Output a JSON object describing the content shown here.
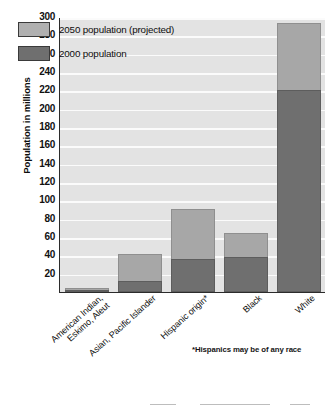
{
  "chart_data": {
    "type": "bar",
    "title": "",
    "xlabel": "",
    "ylabel": "Population in millions",
    "ylim": [
      0,
      300
    ],
    "ytick_step": 20,
    "yticks": [
      300,
      280,
      260,
      240,
      220,
      200,
      180,
      160,
      140,
      120,
      100,
      80,
      60,
      40,
      20
    ],
    "grid": true,
    "stacked": true,
    "legend_position": "top-left",
    "categories": [
      "American Indian, Eskimo, Aleut",
      "Asian, Pacific Islander",
      "Hispanic origin*",
      "Black",
      "White"
    ],
    "category_lines": [
      [
        "American Indian,",
        "Eskimo, Aleut"
      ],
      [
        "Asian, Pacific Islander"
      ],
      [
        "Hispanic origin*"
      ],
      [
        "Black"
      ],
      [
        "White"
      ]
    ],
    "series": [
      {
        "name": "2050 population (projected)",
        "color": "#a7a7a7",
        "values": [
          4,
          41,
          91,
          64,
          293
        ]
      },
      {
        "name": "2000 population",
        "color": "#6f6f6f",
        "values": [
          2,
          12,
          36,
          38,
          220
        ]
      }
    ],
    "annotations": [
      "*Hispanics may be of any race"
    ]
  },
  "legend": {
    "items": [
      {
        "label": "2050 population (projected)",
        "color": "#a7a7a7"
      },
      {
        "label": "2000 population",
        "color": "#6f6f6f"
      }
    ]
  },
  "axis": {
    "y_title": "Population in millions"
  },
  "footnote": {
    "text": "*Hispanics may be of any race"
  },
  "colors": {
    "plot_background": "#e3e3e3",
    "gridline": "#fbfbfb",
    "axis": "#2b2b2b",
    "series_2050": "#a7a7a7",
    "series_2000": "#6f6f6f"
  }
}
